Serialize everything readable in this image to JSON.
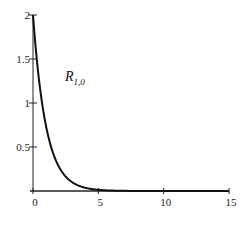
{
  "chart_data": {
    "type": "line",
    "title": "",
    "xlabel": "",
    "ylabel": "",
    "xlim": [
      0,
      15
    ],
    "ylim": [
      0,
      2
    ],
    "grid": false,
    "legend": "none",
    "annotations": [
      {
        "text": "R",
        "subscript": "1,0",
        "x": 2.2,
        "y": 1.35
      }
    ],
    "x_ticks": [
      0,
      5,
      10,
      15
    ],
    "x_tick_labels": [
      "0",
      "5",
      "10",
      "15"
    ],
    "y_ticks": [
      0.5,
      1,
      1.5,
      2
    ],
    "y_tick_labels": [
      "0.5",
      "1",
      "1.5",
      "2"
    ],
    "series": [
      {
        "name": "R_{1,0}",
        "formula": "2*exp(-r)",
        "x": [
          0,
          0.5,
          1,
          1.5,
          2,
          2.5,
          3,
          3.5,
          4,
          5,
          6,
          8,
          10,
          15
        ],
        "values": [
          2.0,
          1.213,
          0.736,
          0.446,
          0.271,
          0.164,
          0.1,
          0.06,
          0.037,
          0.013,
          0.005,
          0.001,
          0.0,
          0.0
        ]
      }
    ]
  },
  "label": {
    "main": "R",
    "sub": "1,0"
  }
}
